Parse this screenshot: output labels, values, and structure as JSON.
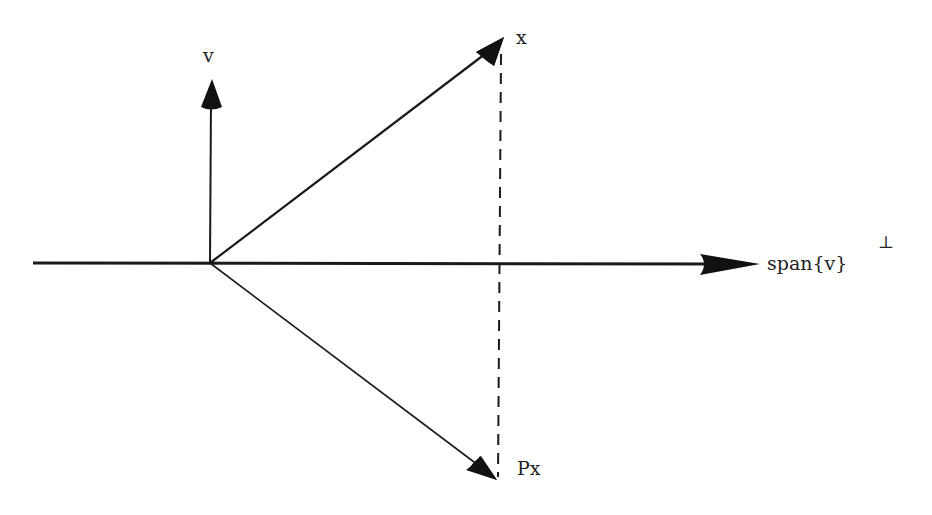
{
  "diagram": {
    "colors": {
      "ink": "#1a1a1a",
      "background": "#ffffff"
    },
    "origin": [
      210,
      263
    ],
    "labels": {
      "v": "v",
      "x": "x",
      "px": "Px",
      "span": "span{v}",
      "perp": "⊥"
    },
    "vectors": [
      {
        "name": "v",
        "from": [
          210,
          263
        ],
        "to": [
          210,
          80
        ],
        "style": "solid"
      },
      {
        "name": "x",
        "from": [
          210,
          263
        ],
        "to": [
          503,
          40
        ],
        "style": "solid"
      },
      {
        "name": "Px",
        "from": [
          210,
          263
        ],
        "to": [
          496,
          479
        ],
        "style": "solid"
      }
    ],
    "axis": {
      "name": "span{v}⊥",
      "from": [
        33,
        263
      ],
      "to": [
        760,
        263
      ]
    },
    "projection_line": {
      "from": [
        500,
        52
      ],
      "to": [
        498,
        477
      ],
      "style": "dashed"
    }
  }
}
